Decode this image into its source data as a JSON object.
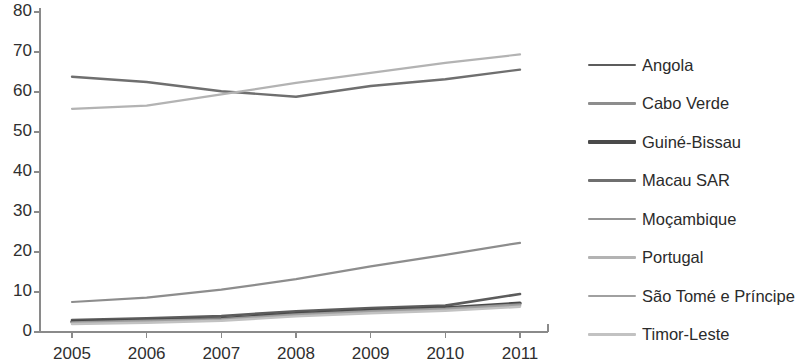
{
  "chart_data": {
    "type": "line",
    "title": "",
    "xlabel": "",
    "ylabel": "",
    "x": [
      2005,
      2006,
      2007,
      2008,
      2009,
      2010,
      2011
    ],
    "categories": [
      "2005",
      "2006",
      "2007",
      "2008",
      "2009",
      "2010",
      "2011"
    ],
    "xlim": [
      2005,
      2011
    ],
    "ylim": [
      0,
      80
    ],
    "yticks": [
      0,
      10,
      20,
      30,
      40,
      50,
      60,
      70,
      80
    ],
    "ytick_labels": [
      "0",
      "10",
      "20",
      "30",
      "40",
      "50",
      "60",
      "70",
      "80"
    ],
    "xtick_labels": [
      "2005",
      "2006",
      "2007",
      "2008",
      "2009",
      "2010",
      "2011"
    ],
    "grid": false,
    "legend_position": "right",
    "series": [
      {
        "name": "Angola",
        "color": "#5c5c5c",
        "width": 2.6,
        "values": [
          3.0,
          3.4,
          4.0,
          5.2,
          6.0,
          6.6,
          9.5
        ]
      },
      {
        "name": "Cabo Verde",
        "color": "#8d8d8d",
        "width": 2.2,
        "values": [
          7.5,
          8.6,
          10.6,
          13.2,
          16.4,
          19.3,
          22.3
        ]
      },
      {
        "name": "Guiné-Bissau",
        "color": "#4a4a4a",
        "width": 3.4,
        "values": [
          2.6,
          2.9,
          3.3,
          4.6,
          5.4,
          6.0,
          7.2
        ]
      },
      {
        "name": "Macau SAR",
        "color": "#6f6f6f",
        "width": 2.4,
        "values": [
          63.8,
          62.5,
          60.2,
          58.8,
          61.5,
          63.2,
          65.6
        ]
      },
      {
        "name": "Moçambique",
        "color": "#949494",
        "width": 2.4,
        "values": [
          2.4,
          2.8,
          3.2,
          4.4,
          5.2,
          5.8,
          6.9
        ]
      },
      {
        "name": "Portugal",
        "color": "#b3b3b3",
        "width": 2.2,
        "values": [
          55.8,
          56.6,
          59.4,
          62.3,
          64.8,
          67.3,
          69.4
        ]
      },
      {
        "name": "São Tomé e Príncipe",
        "color": "#a0a0a0",
        "width": 2.6,
        "values": [
          2.2,
          2.6,
          3.0,
          4.2,
          5.0,
          5.6,
          6.6
        ]
      },
      {
        "name": "Timor-Leste",
        "color": "#c2c2c2",
        "width": 2.4,
        "values": [
          2.0,
          2.3,
          2.8,
          3.9,
          4.7,
          5.3,
          6.3
        ]
      }
    ]
  },
  "axes": {
    "axis_color": "#8a8a8a",
    "tick_color": "#8a8a8a"
  }
}
